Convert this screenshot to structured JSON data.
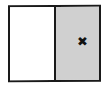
{
  "diagram": {
    "panels": [
      {
        "name": "left",
        "fill": "#ffffff"
      },
      {
        "name": "right",
        "fill": "#d6d6d6",
        "pattern": "stipple"
      }
    ],
    "marker": {
      "icon": "x-mark-icon",
      "glyph": "✖",
      "panel": "right"
    },
    "colors": {
      "border": "#1a1a1a",
      "shaded": "#d6d6d6",
      "marker": "#111111"
    }
  }
}
